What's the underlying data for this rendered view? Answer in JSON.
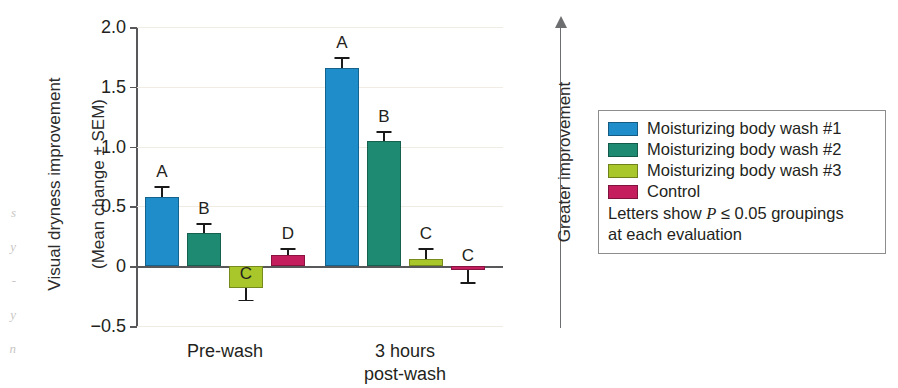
{
  "axes": {
    "ylabel_line1": "Visual dryness improvement",
    "ylabel_line2": "(Mean change ± SEM)",
    "ytick_labels": [
      "2.0",
      "1.5",
      "1.0",
      "0.5",
      "0",
      "−0.5"
    ],
    "xtick_labels": [
      "Pre-wash",
      "3 hours\npost-wash"
    ]
  },
  "annotation": {
    "arrow_label": "Greater improvement"
  },
  "legend": {
    "items": [
      {
        "label": "Moisturizing body wash #1",
        "color": "#1f8dc9"
      },
      {
        "label": "Moisturizing body wash #2",
        "color": "#1f8a72"
      },
      {
        "label": "Moisturizing body wash #3",
        "color": "#a9c62a"
      },
      {
        "label": "Control",
        "color": "#c41e5e"
      }
    ],
    "note_line1_pre": "Letters show ",
    "note_line1_italic": "P",
    "note_line1_post": " ≤ 0.05 groupings",
    "note_line2": "at each evaluation"
  },
  "edge_bleed": "s\ny\n-\ny\nn",
  "chart_data": {
    "type": "bar",
    "title": "",
    "xlabel": "",
    "ylabel": "Visual dryness improvement (Mean change ± SEM)",
    "ylim": [
      -0.5,
      2.0
    ],
    "yticks": [
      -0.5,
      0,
      0.5,
      1.0,
      1.5,
      2.0
    ],
    "grid": true,
    "legend_position": "right-outside",
    "categories": [
      "Pre-wash",
      "3 hours post-wash"
    ],
    "series": [
      {
        "name": "Moisturizing body wash #1",
        "color": "#1f8dc9",
        "values": [
          0.58,
          1.66
        ],
        "errors": [
          0.09,
          0.09
        ],
        "letters": [
          "A",
          "A"
        ]
      },
      {
        "name": "Moisturizing body wash #2",
        "color": "#1f8a72",
        "values": [
          0.28,
          1.05
        ],
        "errors": [
          0.08,
          0.08
        ],
        "letters": [
          "B",
          "B"
        ]
      },
      {
        "name": "Moisturizing body wash #3",
        "color": "#a9c62a",
        "values": [
          -0.18,
          0.06
        ],
        "errors": [
          0.1,
          0.09
        ],
        "letters": [
          "C",
          "C"
        ]
      },
      {
        "name": "Control",
        "color": "#c41e5e",
        "values": [
          0.09,
          -0.03
        ],
        "errors": [
          0.06,
          0.1
        ],
        "letters": [
          "D",
          "C"
        ]
      }
    ]
  },
  "layout": {
    "plot_left": 137,
    "plot_top": 27,
    "plot_width": 366,
    "plot_height": 299,
    "group_centers": [
      88,
      268
    ],
    "bar_width": 34,
    "bar_gap": 8
  }
}
